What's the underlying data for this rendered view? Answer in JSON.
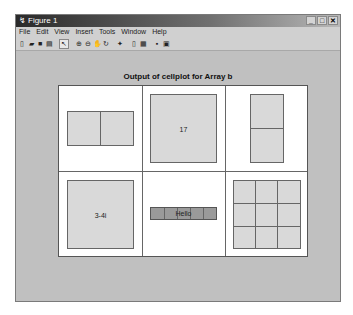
{
  "window": {
    "title": "Figure 1",
    "controls": [
      {
        "name": "minimize-button",
        "glyph": "_"
      },
      {
        "name": "maximize-button",
        "glyph": "□"
      },
      {
        "name": "close-button",
        "glyph": "✕"
      }
    ]
  },
  "menubar": {
    "items": [
      "File",
      "Edit",
      "View",
      "Insert",
      "Tools",
      "Window",
      "Help"
    ]
  },
  "toolbar": {
    "buttons": [
      {
        "name": "new-figure",
        "glyph": "▯"
      },
      {
        "name": "open-file",
        "glyph": "▰"
      },
      {
        "name": "save-figure",
        "glyph": "■"
      },
      {
        "name": "print-figure",
        "glyph": "▤"
      },
      {
        "name": "edit-plot",
        "glyph": "↖"
      },
      {
        "name": "zoom-in",
        "glyph": "⊕"
      },
      {
        "name": "zoom-out",
        "glyph": "⊖"
      },
      {
        "name": "pan",
        "glyph": "✋"
      },
      {
        "name": "rotate-3d",
        "glyph": "↻"
      },
      {
        "name": "data-cursor",
        "glyph": "✦"
      },
      {
        "name": "insert-colorbar",
        "glyph": "▯"
      },
      {
        "name": "insert-legend",
        "glyph": "▦"
      },
      {
        "name": "hide-plot-tools",
        "glyph": "▪"
      },
      {
        "name": "show-plot-tools",
        "glyph": "▣"
      }
    ]
  },
  "plot": {
    "title": "Output of cellplot for Array b",
    "cells": [
      {
        "row": 1,
        "col": 1,
        "kind": "array",
        "shape": [
          1,
          2
        ],
        "label": ""
      },
      {
        "row": 1,
        "col": 2,
        "kind": "scalar",
        "label": "17"
      },
      {
        "row": 1,
        "col": 3,
        "kind": "array",
        "shape": [
          2,
          1
        ],
        "label": ""
      },
      {
        "row": 2,
        "col": 1,
        "kind": "scalar",
        "label": "3-4i"
      },
      {
        "row": 2,
        "col": 2,
        "kind": "string",
        "label": "Hello"
      },
      {
        "row": 2,
        "col": 3,
        "kind": "array",
        "shape": [
          3,
          3
        ],
        "label": ""
      }
    ]
  }
}
